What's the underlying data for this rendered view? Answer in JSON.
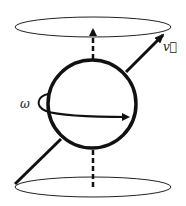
{
  "diagram": {
    "title": "",
    "labels": {
      "velocity": "v⃗",
      "angular": "ω"
    },
    "colors": {
      "stroke": "#111111",
      "background": "#ffffff"
    }
  }
}
